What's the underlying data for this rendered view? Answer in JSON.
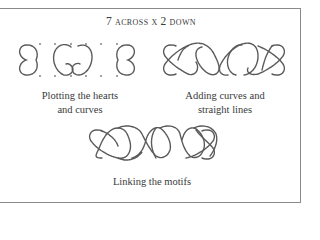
{
  "figure": {
    "title": {
      "across_number": "7",
      "across_word": "across",
      "times": "x",
      "down_number": "2",
      "down_word": "down"
    },
    "panels": [
      {
        "id": "plotting",
        "caption_line1": "Plotting the hearts",
        "caption_line2": "and curves"
      },
      {
        "id": "adding",
        "caption_line1": "Adding curves and",
        "caption_line2": "straight lines"
      },
      {
        "id": "linking",
        "caption_line1": "Linking the motifs"
      }
    ],
    "colors": {
      "line": "#5a5a5a",
      "border": "#8a8a8a",
      "text": "#3a3a3a",
      "background": "#ffffff"
    }
  }
}
